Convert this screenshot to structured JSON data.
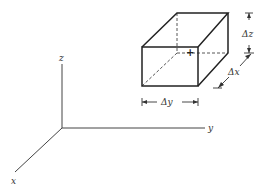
{
  "figure": {
    "axes": {
      "x_label": "x",
      "y_label": "y",
      "z_label": "z"
    },
    "dimensions": {
      "dz_label": "Δz",
      "dx_label": "Δx",
      "dy_label": "Δy"
    },
    "center_marker": "+"
  }
}
